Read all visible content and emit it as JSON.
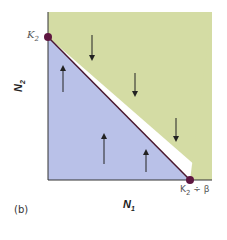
{
  "diagram": {
    "panel_label": "(b)",
    "x_axis": {
      "label": "N",
      "subscript": "1"
    },
    "y_axis": {
      "label": "N",
      "subscript": "2"
    },
    "y_intercept": {
      "label": "K",
      "subscript": "2"
    },
    "x_intercept": {
      "label": "K",
      "subscript": "2",
      "suffix": " ÷ β"
    },
    "regions": [
      {
        "name": "above-isocline",
        "color": "#d4dca4",
        "arrow_direction": "down",
        "arrow_count": 3
      },
      {
        "name": "below-isocline",
        "color": "#b9c1e8",
        "arrow_direction": "up",
        "arrow_count": 3
      }
    ],
    "isocline_color": "#4a1830",
    "point_color": "#5e1640",
    "axis_color": "#333333"
  }
}
